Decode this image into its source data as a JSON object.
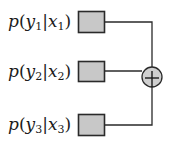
{
  "diagram": {
    "type": "sum-of-factors",
    "colors": {
      "box_fill": "#c8c8c8",
      "box_stroke": "#2a2a2a",
      "line": "#2a2a2a",
      "circle_fill": "#cfcfcf"
    },
    "factors": [
      {
        "func": "p",
        "y": "y",
        "y_sub": "1",
        "x": "x",
        "x_sub": "1",
        "text": "p(y1|x1)"
      },
      {
        "func": "p",
        "y": "y",
        "y_sub": "2",
        "x": "x",
        "x_sub": "2",
        "text": "p(y2|x2)"
      },
      {
        "func": "p",
        "y": "y",
        "y_sub": "3",
        "x": "x",
        "x_sub": "3",
        "text": "p(y3|x3)"
      }
    ],
    "operator": {
      "symbol": "+",
      "name": "sum"
    }
  }
}
